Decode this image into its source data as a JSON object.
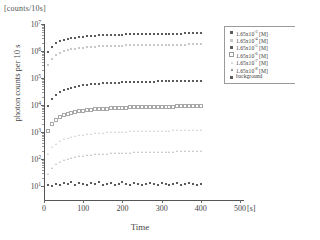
{
  "header": {
    "units": "[counts/10s]"
  },
  "axes": {
    "ylabel": "photon counts per 10 s",
    "xlabel": "Time",
    "x_unit": "[s]",
    "xticks": [
      "0",
      "100",
      "200",
      "300",
      "400",
      "500"
    ],
    "yticks": [
      "10",
      "10",
      "10",
      "10",
      "10",
      "10",
      "10"
    ],
    "yexponents": [
      "7",
      "6",
      "5",
      "4",
      "3",
      "2",
      "1"
    ]
  },
  "legend": {
    "items": [
      {
        "label_prefix": "1.65x10",
        "exponent": "-3",
        "label_suffix": " [M]",
        "marker": "square-filled",
        "name": "legend-series-1"
      },
      {
        "label_prefix": "1.65x10",
        "exponent": "-4",
        "label_suffix": " [M]",
        "marker": "square-gray",
        "name": "legend-series-2"
      },
      {
        "label_prefix": "1.65x10",
        "exponent": "-5",
        "label_suffix": " [M]",
        "marker": "square-filled",
        "name": "legend-series-3"
      },
      {
        "label_prefix": "1.65x10",
        "exponent": "-6",
        "label_suffix": " [M]",
        "marker": "square-open",
        "name": "legend-series-4"
      },
      {
        "label_prefix": "1.65x10",
        "exponent": "-7",
        "label_suffix": " [M]",
        "marker": "triangle-open",
        "name": "legend-series-5"
      },
      {
        "label_prefix": "1.65x10",
        "exponent": "-8",
        "label_suffix": " [M]",
        "marker": "triangle-filled",
        "name": "legend-series-6"
      },
      {
        "label_prefix": "background",
        "exponent": "",
        "label_suffix": "",
        "marker": "square-filled",
        "name": "legend-series-background"
      }
    ]
  },
  "chart_data": {
    "type": "scatter",
    "title": "",
    "xlabel": "Time",
    "ylabel": "photon counts per 10 s",
    "xlim": [
      0,
      510
    ],
    "ylim": [
      3,
      10000000
    ],
    "yscale": "log",
    "grid": false,
    "legend_position": "top-right",
    "x": [
      10,
      20,
      30,
      40,
      50,
      60,
      70,
      80,
      90,
      100,
      110,
      120,
      130,
      140,
      150,
      160,
      170,
      180,
      190,
      200,
      210,
      220,
      230,
      240,
      250,
      260,
      270,
      280,
      290,
      300,
      310,
      320,
      330,
      340,
      350,
      360,
      370,
      380,
      390,
      400
    ],
    "series": [
      {
        "name": "1.65x10^-3 [M]",
        "marker": "square-filled",
        "color": "#5a5a5a",
        "values": [
          900000,
          1450000,
          1900000,
          2250000,
          2550000,
          2780000,
          2980000,
          3150000,
          3300000,
          3420000,
          3530000,
          3620000,
          3700000,
          3780000,
          3840000,
          3900000,
          3950000,
          4000000,
          4040000,
          4080000,
          4120000,
          4150000,
          4180000,
          4210000,
          4240000,
          4260000,
          4290000,
          4310000,
          4330000,
          4350000,
          4370000,
          4390000,
          4400000,
          4420000,
          4430000,
          4450000,
          4460000,
          4480000,
          4490000,
          4500000
        ]
      },
      {
        "name": "1.65x10^-4 [M]",
        "marker": "square-gray",
        "color": "#c9c9c9",
        "values": [
          300000,
          520000,
          700000,
          850000,
          970000,
          1070000,
          1150000,
          1220000,
          1280000,
          1330000,
          1370000,
          1410000,
          1440000,
          1470000,
          1500000,
          1520000,
          1540000,
          1560000,
          1580000,
          1590000,
          1610000,
          1620000,
          1630000,
          1645000,
          1655000,
          1665000,
          1675000,
          1685000,
          1690000,
          1700000,
          1705000,
          1712000,
          1718000,
          1724000,
          1730000,
          1735000,
          1740000,
          1745000,
          1750000,
          1755000
        ]
      },
      {
        "name": "1.65x10^-5 [M]",
        "marker": "square-filled",
        "color": "#5a5a5a",
        "values": [
          9000,
          17000,
          24000,
          30000,
          35500,
          40000,
          44000,
          47500,
          50500,
          53000,
          55500,
          57500,
          59500,
          61000,
          62500,
          64000,
          65000,
          66000,
          67000,
          68000,
          69000,
          69800,
          70500,
          71200,
          71800,
          72400,
          73000,
          73500,
          74000,
          74400,
          74800,
          75200,
          75600,
          76000,
          76300,
          76600,
          76900,
          77200,
          77500,
          77800
        ]
      },
      {
        "name": "1.65x10^-6 [M]",
        "marker": "square-open",
        "color": "#a8a8a8",
        "values": [
          1100,
          2000,
          2800,
          3500,
          4100,
          4600,
          5050,
          5450,
          5800,
          6100,
          6380,
          6620,
          6840,
          7040,
          7220,
          7380,
          7520,
          7650,
          7770,
          7880,
          7980,
          8070,
          8150,
          8230,
          8300,
          8370,
          8430,
          8490,
          8540,
          8590,
          8640,
          8680,
          8720,
          8760,
          8800,
          8830,
          8860,
          8890,
          8920,
          8950
        ]
      },
      {
        "name": "1.65x10^-7 [M]",
        "marker": "triangle-open",
        "color": "#cfcfcf",
        "values": [
          150,
          270,
          370,
          460,
          535,
          600,
          655,
          705,
          750,
          790,
          825,
          855,
          885,
          910,
          935,
          955,
          975,
          992,
          1008,
          1022,
          1035,
          1047,
          1058,
          1068,
          1077,
          1086,
          1094,
          1101,
          1108,
          1115,
          1121,
          1127,
          1132,
          1137,
          1142,
          1146,
          1150,
          1154,
          1158,
          1162
        ]
      },
      {
        "name": "1.65x10^-8 [M]",
        "marker": "triangle-filled",
        "color": "#bdbdbd",
        "values": [
          28,
          48,
          65,
          79,
          91,
          101,
          110,
          118,
          125,
          131,
          137,
          142,
          146,
          150,
          154,
          157,
          160,
          163,
          166,
          168,
          170,
          172,
          174,
          176,
          178,
          179,
          181,
          182,
          184,
          185,
          186,
          187,
          188,
          189,
          190,
          191,
          192,
          193,
          194,
          195
        ]
      },
      {
        "name": "background",
        "marker": "square-filled",
        "color": "#5a5a5a",
        "values": [
          11,
          10,
          12,
          11,
          13,
          12,
          14,
          11,
          13,
          12,
          11,
          13,
          12,
          14,
          11,
          12,
          13,
          11,
          12,
          14,
          12,
          11,
          13,
          12,
          11,
          12,
          13,
          12,
          11,
          13,
          12,
          11,
          12,
          13,
          11,
          12,
          13,
          12,
          11,
          12
        ]
      }
    ]
  }
}
